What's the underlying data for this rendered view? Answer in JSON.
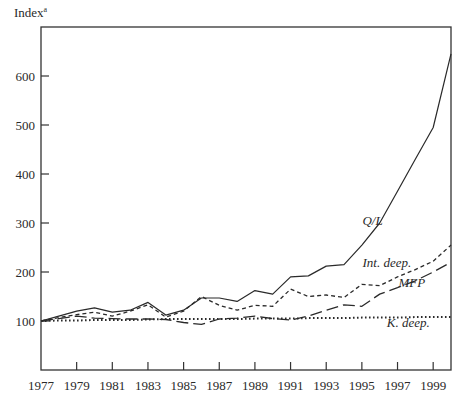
{
  "chart_data": {
    "type": "line",
    "title": "",
    "ylabel": "Index",
    "ylabel_footnote": "a",
    "xlabel": "",
    "x": [
      1977,
      1978,
      1979,
      1980,
      1981,
      1982,
      1983,
      1984,
      1985,
      1986,
      1987,
      1988,
      1989,
      1990,
      1991,
      1992,
      1993,
      1994,
      1995,
      1996,
      1997,
      1998,
      1999,
      2000
    ],
    "xticks": [
      1977,
      1979,
      1981,
      1983,
      1985,
      1987,
      1989,
      1991,
      1993,
      1995,
      1997,
      1999
    ],
    "yticks": [
      100,
      200,
      300,
      400,
      500,
      600
    ],
    "xlim": [
      1977,
      2000
    ],
    "ylim": [
      0,
      700
    ],
    "grid": false,
    "legend": "inline labels",
    "series": [
      {
        "name": "Q/L",
        "style": "solid",
        "label_pos": [
          1995.6,
          295
        ],
        "values": [
          100,
          110,
          120,
          127,
          118,
          122,
          138,
          112,
          122,
          147,
          147,
          140,
          162,
          155,
          190,
          192,
          212,
          215,
          255,
          300,
          365,
          430,
          495,
          645
        ]
      },
      {
        "name": "Int. deep.",
        "style": "short-dash",
        "label_pos": [
          1996.4,
          210
        ],
        "values": [
          100,
          107,
          113,
          118,
          110,
          120,
          133,
          108,
          120,
          150,
          132,
          122,
          132,
          130,
          165,
          150,
          153,
          148,
          175,
          172,
          190,
          205,
          222,
          255
        ]
      },
      {
        "name": "MFP",
        "style": "long-dash",
        "label_pos": [
          1997.8,
          170
        ],
        "values": [
          100,
          105,
          110,
          106,
          105,
          104,
          104,
          103,
          97,
          93,
          104,
          106,
          110,
          105,
          102,
          110,
          122,
          133,
          130,
          155,
          168,
          182,
          200,
          220
        ]
      },
      {
        "name": "K. deep.",
        "style": "dotted",
        "label_pos": [
          1997.6,
          88
        ],
        "values": [
          100,
          101,
          101,
          102,
          102,
          102,
          103,
          104,
          104,
          104,
          104,
          104,
          105,
          105,
          105,
          106,
          106,
          106,
          107,
          107,
          107,
          108,
          108,
          108
        ]
      }
    ]
  }
}
